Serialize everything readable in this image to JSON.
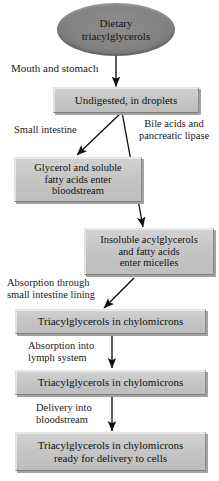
{
  "diagram": {
    "colors": {
      "oval_fill": "#828282",
      "box_fill": "#c6c6c6",
      "box_shadow": "#a2a2a2",
      "text": "#121212",
      "arrow": "#111111",
      "background": "#ffffff"
    },
    "nodes": [
      {
        "id": "dietary-triacylglycerols",
        "shape": "oval",
        "text": "Dietary\ntriacylglycerols"
      },
      {
        "id": "undigested-droplets",
        "shape": "box",
        "text": "Undigested, in droplets"
      },
      {
        "id": "glycerol-soluble-fatty-acids",
        "shape": "box",
        "text": "Glycerol and soluble\nfatty acids enter\nbloodstream"
      },
      {
        "id": "insoluble-acylglycerols",
        "shape": "box",
        "text": "Insoluble acylglycerols\nand fatty acids\nenter micelles"
      },
      {
        "id": "triacylglycerols-chylomicrons-1",
        "shape": "box",
        "text": "Triacylglycerols in chylomicrons"
      },
      {
        "id": "triacylglycerols-chylomicrons-2",
        "shape": "box",
        "text": "Triacylglycerols in chylomicrons"
      },
      {
        "id": "triacylglycerols-ready-for-delivery",
        "shape": "box",
        "text": "Triacylglycerols in chylomicrons\nready for delivery to cells"
      }
    ],
    "labels": [
      {
        "id": "mouth-and-stomach",
        "text": "Mouth and stomach"
      },
      {
        "id": "small-intestine",
        "text": "Small intestine"
      },
      {
        "id": "bile-acids-pancreatic-lipase",
        "text": "Bile acids and\npancreatic lipase"
      },
      {
        "id": "absorption-through-lining",
        "text": "Absorption through\nsmall intestine lining"
      },
      {
        "id": "absorption-into-lymph",
        "text": "Absorption into\nlymph system"
      },
      {
        "id": "delivery-into-bloodstream",
        "text": "Delivery into\nbloodstream"
      }
    ],
    "edges": [
      {
        "id": "edge-dietary-to-undigested",
        "from": "dietary-triacylglycerols",
        "to": "undigested-droplets",
        "label": "mouth-and-stomach",
        "style": "vertical"
      },
      {
        "id": "edge-undigested-to-glycerol",
        "from": "undigested-droplets",
        "to": "glycerol-soluble-fatty-acids",
        "label": "small-intestine",
        "style": "diagonal-left"
      },
      {
        "id": "edge-undigested-to-insoluble",
        "from": "undigested-droplets",
        "to": "insoluble-acylglycerols",
        "label": "bile-acids-pancreatic-lipase",
        "style": "diagonal-right"
      },
      {
        "id": "edge-insoluble-to-chylomicrons1",
        "from": "insoluble-acylglycerols",
        "to": "triacylglycerols-chylomicrons-1",
        "label": "absorption-through-lining",
        "style": "diagonal-left"
      },
      {
        "id": "edge-chylomicrons1-to-chylomicrons2",
        "from": "triacylglycerols-chylomicrons-1",
        "to": "triacylglycerols-chylomicrons-2",
        "label": "absorption-into-lymph",
        "style": "vertical"
      },
      {
        "id": "edge-chylomicrons2-to-ready",
        "from": "triacylglycerols-chylomicrons-2",
        "to": "triacylglycerols-ready-for-delivery",
        "label": "delivery-into-bloodstream",
        "style": "vertical"
      }
    ]
  }
}
